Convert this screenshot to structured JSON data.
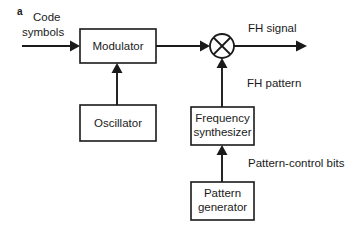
{
  "figure": {
    "panel_letter": "a",
    "type": "block-diagram"
  },
  "blocks": [
    {
      "id": "modulator",
      "label": "Modulator",
      "label_line1": "Modulator",
      "label_line2": "",
      "x": 80,
      "y": 29,
      "width": 76,
      "height": 34
    },
    {
      "id": "oscillator",
      "label": "Oscillator",
      "label_line1": "Oscillator",
      "label_line2": "",
      "x": 80,
      "y": 105,
      "width": 76,
      "height": 36
    },
    {
      "id": "frequency-synthesizer",
      "label": "Frequency synthesizer",
      "label_line1": "Frequency",
      "label_line2": "synthesizer",
      "x": 191,
      "y": 107,
      "width": 63,
      "height": 38
    },
    {
      "id": "pattern-generator",
      "label": "Pattern generator",
      "label_line1": "Pattern",
      "label_line2": "generator",
      "x": 191,
      "y": 182,
      "width": 63,
      "height": 38
    }
  ],
  "mixer": {
    "id": "mixer",
    "symbol": "multiplier-x",
    "center_x": 222,
    "center_y": 46,
    "radius": 12
  },
  "signals": {
    "input_label_line1": "Code",
    "input_label_line2": "symbols",
    "output_label": "FH signal",
    "fh_pattern_label": "FH pattern",
    "pattern_control_label": "Pattern-control bits"
  },
  "colors": {
    "line": "#1a1a1a",
    "background": "#ffffff",
    "text": "#1a1a1a"
  }
}
